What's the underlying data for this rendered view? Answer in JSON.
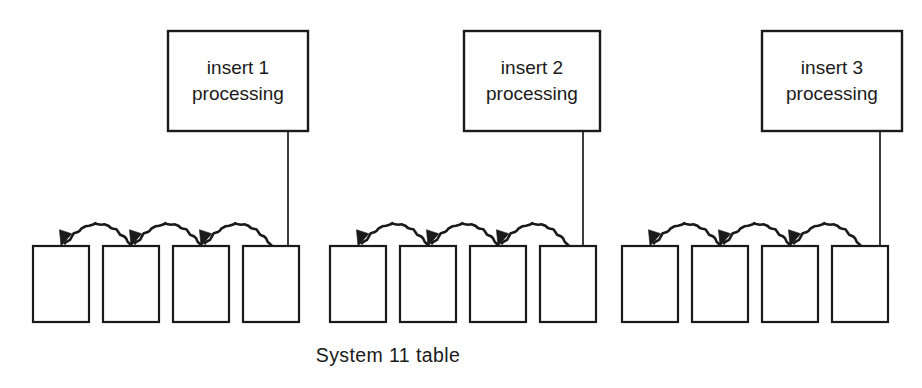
{
  "diagram": {
    "caption": "System 11 table",
    "background_color": "#ffffff",
    "stroke_color": "#1a1a1a",
    "groups": [
      {
        "id": "group-1",
        "process_box": {
          "line1": "insert 1",
          "line2": "processing",
          "x": 168,
          "y": 31,
          "width": 140,
          "height": 100
        },
        "connector": {
          "from_x": 288,
          "from_y": 131,
          "to_x": 288,
          "to_y": 292
        },
        "cells_x": [
          33,
          103,
          173,
          243
        ],
        "cell_y": 246,
        "cell_width": 56,
        "cell_height": 76,
        "hops": [
          {
            "from_x": 131,
            "to_x": 61,
            "apex_y": 212
          },
          {
            "from_x": 201,
            "to_x": 131,
            "apex_y": 212
          },
          {
            "from_x": 271,
            "to_x": 201,
            "apex_y": 212
          }
        ]
      },
      {
        "id": "group-2",
        "process_box": {
          "line1": "insert 2",
          "line2": "processing",
          "x": 464,
          "y": 31,
          "width": 136,
          "height": 100
        },
        "connector": {
          "from_x": 583,
          "from_y": 131,
          "to_x": 583,
          "to_y": 292
        },
        "cells_x": [
          330,
          400,
          470,
          540
        ],
        "cell_y": 246,
        "cell_width": 56,
        "cell_height": 76,
        "hops": [
          {
            "from_x": 428,
            "to_x": 358,
            "apex_y": 212
          },
          {
            "from_x": 498,
            "to_x": 428,
            "apex_y": 212
          },
          {
            "from_x": 568,
            "to_x": 498,
            "apex_y": 212
          }
        ]
      },
      {
        "id": "group-3",
        "process_box": {
          "line1": "insert 3",
          "line2": "processing",
          "x": 762,
          "y": 31,
          "width": 140,
          "height": 100
        },
        "connector": {
          "from_x": 880,
          "from_y": 131,
          "to_x": 880,
          "to_y": 292
        },
        "cells_x": [
          622,
          692,
          762,
          832
        ],
        "cell_y": 246,
        "cell_width": 56,
        "cell_height": 76,
        "hops": [
          {
            "from_x": 720,
            "to_x": 650,
            "apex_y": 212
          },
          {
            "from_x": 790,
            "to_x": 720,
            "apex_y": 212
          },
          {
            "from_x": 860,
            "to_x": 790,
            "apex_y": 212
          }
        ]
      }
    ],
    "caption_position": {
      "x": 388,
      "y": 362
    }
  }
}
